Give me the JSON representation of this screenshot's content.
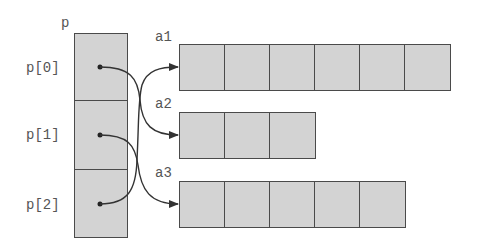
{
  "diagram": {
    "pointer_array": {
      "name": "p",
      "elements": [
        {
          "label": "p[0]",
          "points_to": "a2"
        },
        {
          "label": "p[1]",
          "points_to": "a3"
        },
        {
          "label": "p[2]",
          "points_to": "a1"
        }
      ]
    },
    "arrays": [
      {
        "name": "a1",
        "length": 6
      },
      {
        "name": "a2",
        "length": 3
      },
      {
        "name": "a3",
        "length": 5
      }
    ],
    "colors": {
      "cell_fill": "#d3d3d3",
      "border": "#4a4a4a",
      "text": "#555555",
      "arrow": "#333333"
    }
  }
}
